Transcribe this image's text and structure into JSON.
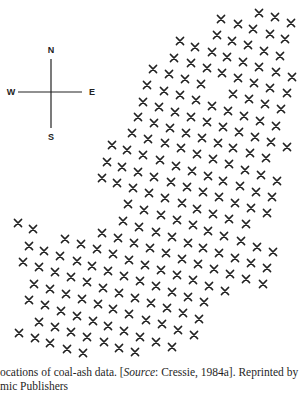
{
  "figure": {
    "marker": "x",
    "marker_color": "#222222",
    "compass": {
      "north": "N",
      "south": "S",
      "east": "E",
      "west": "W"
    }
  },
  "caption": {
    "line1_prefix": "ocations of coal-ash data. [",
    "line1_source_label": "Source",
    "line1_suffix": ": Cressie, 1984a]. Reprinted by",
    "line2": "mic Publishers"
  },
  "chart_data": {
    "type": "scatter",
    "xlabel": "",
    "ylabel": "",
    "grid": false,
    "legend": null,
    "points": [
      [
        259,
        13
      ],
      [
        275,
        17
      ],
      [
        291,
        23
      ],
      [
        221,
        19
      ],
      [
        238,
        24
      ],
      [
        253,
        29
      ],
      [
        270,
        34
      ],
      [
        285,
        39
      ],
      [
        217,
        35
      ],
      [
        232,
        41
      ],
      [
        248,
        45
      ],
      [
        264,
        51
      ],
      [
        280,
        56
      ],
      [
        180,
        41
      ],
      [
        195,
        47
      ],
      [
        212,
        52
      ],
      [
        227,
        57
      ],
      [
        243,
        62
      ],
      [
        259,
        67
      ],
      [
        276,
        72
      ],
      [
        292,
        77
      ],
      [
        174,
        58
      ],
      [
        191,
        63
      ],
      [
        207,
        68
      ],
      [
        222,
        73
      ],
      [
        238,
        78
      ],
      [
        254,
        83
      ],
      [
        270,
        88
      ],
      [
        287,
        93
      ],
      [
        153,
        69
      ],
      [
        169,
        74
      ],
      [
        185,
        79
      ],
      [
        201,
        84
      ],
      [
        233,
        94
      ],
      [
        249,
        99
      ],
      [
        265,
        104
      ],
      [
        281,
        109
      ],
      [
        147,
        85
      ],
      [
        164,
        91
      ],
      [
        180,
        95
      ],
      [
        196,
        100
      ],
      [
        212,
        106
      ],
      [
        228,
        111
      ],
      [
        244,
        116
      ],
      [
        260,
        121
      ],
      [
        276,
        126
      ],
      [
        143,
        102
      ],
      [
        159,
        107
      ],
      [
        175,
        112
      ],
      [
        191,
        117
      ],
      [
        207,
        122
      ],
      [
        223,
        127
      ],
      [
        239,
        132
      ],
      [
        255,
        137
      ],
      [
        271,
        142
      ],
      [
        287,
        147
      ],
      [
        138,
        117
      ],
      [
        154,
        123
      ],
      [
        170,
        128
      ],
      [
        186,
        133
      ],
      [
        202,
        138
      ],
      [
        218,
        143
      ],
      [
        233,
        148
      ],
      [
        250,
        153
      ],
      [
        266,
        158
      ],
      [
        132,
        133
      ],
      [
        148,
        139
      ],
      [
        165,
        143
      ],
      [
        181,
        148
      ],
      [
        197,
        154
      ],
      [
        213,
        159
      ],
      [
        229,
        164
      ],
      [
        245,
        170
      ],
      [
        261,
        175
      ],
      [
        277,
        181
      ],
      [
        112,
        145
      ],
      [
        127,
        150
      ],
      [
        143,
        155
      ],
      [
        160,
        160
      ],
      [
        176,
        166
      ],
      [
        192,
        171
      ],
      [
        208,
        176
      ],
      [
        223,
        181
      ],
      [
        240,
        186
      ],
      [
        256,
        192
      ],
      [
        272,
        197
      ],
      [
        107,
        162
      ],
      [
        122,
        167
      ],
      [
        138,
        172
      ],
      [
        154,
        177
      ],
      [
        171,
        182
      ],
      [
        187,
        187
      ],
      [
        203,
        192
      ],
      [
        219,
        197
      ],
      [
        235,
        203
      ],
      [
        251,
        208
      ],
      [
        267,
        213
      ],
      [
        102,
        178
      ],
      [
        117,
        183
      ],
      [
        133,
        188
      ],
      [
        149,
        193
      ],
      [
        165,
        198
      ],
      [
        182,
        203
      ],
      [
        197,
        209
      ],
      [
        213,
        214
      ],
      [
        229,
        219
      ],
      [
        246,
        224
      ],
      [
        128,
        204
      ],
      [
        144,
        210
      ],
      [
        161,
        215
      ],
      [
        177,
        220
      ],
      [
        193,
        225
      ],
      [
        208,
        231
      ],
      [
        224,
        236
      ],
      [
        241,
        241
      ],
      [
        257,
        247
      ],
      [
        273,
        252
      ],
      [
        123,
        221
      ],
      [
        139,
        227
      ],
      [
        156,
        232
      ],
      [
        172,
        237
      ],
      [
        188,
        243
      ],
      [
        203,
        248
      ],
      [
        219,
        253
      ],
      [
        235,
        258
      ],
      [
        251,
        263
      ],
      [
        267,
        268
      ],
      [
        102,
        233
      ],
      [
        118,
        238
      ],
      [
        134,
        243
      ],
      [
        150,
        248
      ],
      [
        166,
        253
      ],
      [
        182,
        259
      ],
      [
        198,
        264
      ],
      [
        214,
        269
      ],
      [
        230,
        274
      ],
      [
        246,
        279
      ],
      [
        263,
        284
      ],
      [
        18,
        223
      ],
      [
        33,
        229
      ],
      [
        65,
        239
      ],
      [
        81,
        244
      ],
      [
        29,
        246
      ],
      [
        44,
        251
      ],
      [
        60,
        256
      ],
      [
        77,
        261
      ],
      [
        92,
        266
      ],
      [
        97,
        249
      ],
      [
        113,
        254
      ],
      [
        129,
        260
      ],
      [
        145,
        265
      ],
      [
        161,
        270
      ],
      [
        177,
        275
      ],
      [
        193,
        280
      ],
      [
        209,
        286
      ],
      [
        225,
        291
      ],
      [
        23,
        262
      ],
      [
        39,
        267
      ],
      [
        55,
        272
      ],
      [
        71,
        277
      ],
      [
        87,
        282
      ],
      [
        108,
        271
      ],
      [
        124,
        276
      ],
      [
        140,
        281
      ],
      [
        156,
        286
      ],
      [
        172,
        292
      ],
      [
        188,
        297
      ],
      [
        204,
        302
      ],
      [
        34,
        284
      ],
      [
        50,
        289
      ],
      [
        66,
        294
      ],
      [
        82,
        299
      ],
      [
        98,
        304
      ],
      [
        103,
        288
      ],
      [
        119,
        293
      ],
      [
        135,
        298
      ],
      [
        151,
        303
      ],
      [
        167,
        308
      ],
      [
        183,
        313
      ],
      [
        199,
        319
      ],
      [
        29,
        300
      ],
      [
        45,
        305
      ],
      [
        61,
        311
      ],
      [
        77,
        316
      ],
      [
        93,
        321
      ],
      [
        108,
        326
      ],
      [
        124,
        331
      ],
      [
        140,
        337
      ],
      [
        156,
        342
      ],
      [
        172,
        347
      ],
      [
        113,
        309
      ],
      [
        129,
        314
      ],
      [
        146,
        320
      ],
      [
        162,
        324
      ],
      [
        178,
        330
      ],
      [
        194,
        335
      ],
      [
        39,
        322
      ],
      [
        55,
        327
      ],
      [
        71,
        332
      ],
      [
        87,
        337
      ],
      [
        104,
        342
      ],
      [
        119,
        348
      ],
      [
        135,
        352
      ],
      [
        19,
        333
      ],
      [
        35,
        338
      ],
      [
        50,
        343
      ],
      [
        67,
        349
      ],
      [
        83,
        353
      ]
    ]
  }
}
